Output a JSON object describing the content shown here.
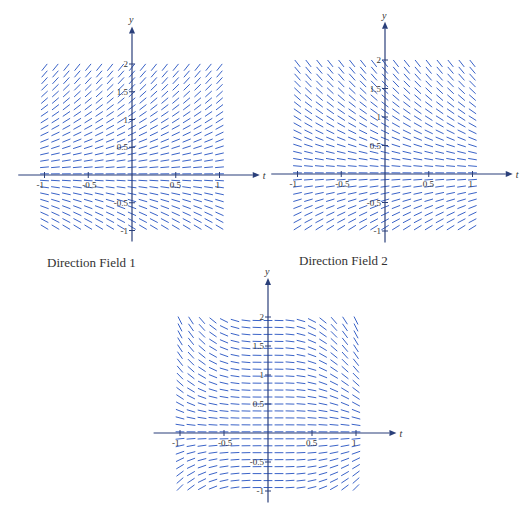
{
  "fields": [
    {
      "id": 1,
      "caption": "Direction Field 1",
      "slope": "y",
      "origin": [
        132,
        175
      ],
      "xscale": 87.5,
      "yscale": 55.5,
      "x_axis_label": "t",
      "y_axis_label": "y",
      "x_ticks": [
        "-1",
        "-0.5",
        "0.5",
        "1"
      ],
      "y_ticks": [
        "2",
        "1.5",
        "1",
        "0.5",
        "-0.5",
        "-1"
      ]
    },
    {
      "id": 2,
      "caption": "Direction Field 2",
      "slope": "-y",
      "origin": [
        385,
        174
      ],
      "xscale": 87.5,
      "yscale": 57,
      "x_axis_label": "t",
      "y_axis_label": "y",
      "x_ticks": [
        "-1",
        "-0.5",
        "0.5",
        "1"
      ],
      "y_ticks": [
        "2",
        "1.5",
        "1",
        "0.5",
        "-0.5",
        "-1"
      ]
    },
    {
      "id": 3,
      "caption": "",
      "slope": "-t^2 y",
      "origin": [
        268,
        433
      ],
      "xscale": 88,
      "yscale": 58,
      "x_axis_label": "t",
      "y_axis_label": "y",
      "x_ticks": [
        "-1",
        "-0.5",
        "0.5",
        "1"
      ],
      "y_ticks": [
        "2",
        "1.5",
        "1",
        "0.5",
        "-0.5",
        "-1"
      ]
    }
  ],
  "colors": {
    "segments": "#3a63c8",
    "axes": "#2a3f7a",
    "labels": "#333333"
  },
  "chart_data": [
    {
      "type": "direction_field",
      "title": "Direction Field 1",
      "xlabel": "t",
      "ylabel": "y",
      "xlim": [
        -1,
        1
      ],
      "ylim": [
        -1,
        2
      ],
      "x_ticks": [
        -1,
        -0.5,
        0.5,
        1
      ],
      "y_ticks": [
        -1,
        -0.5,
        0.5,
        1,
        1.5,
        2
      ],
      "slope_function": "dy/dt = y (approx.)",
      "grid": "17 columns x 26 rows of slope segments"
    },
    {
      "type": "direction_field",
      "title": "Direction Field 2",
      "xlabel": "t",
      "ylabel": "y",
      "xlim": [
        -1,
        1
      ],
      "ylim": [
        -1,
        2
      ],
      "x_ticks": [
        -1,
        -0.5,
        0.5,
        1
      ],
      "y_ticks": [
        -1,
        -0.5,
        0.5,
        1,
        1.5,
        2
      ],
      "slope_function": "dy/dt = -y (approx.)",
      "grid": "17 columns x 26 rows of slope segments"
    },
    {
      "type": "direction_field",
      "title": "",
      "xlabel": "t",
      "ylabel": "y",
      "xlim": [
        -1,
        1
      ],
      "ylim": [
        -1,
        2
      ],
      "x_ticks": [
        -1,
        -0.5,
        0.5,
        1
      ],
      "y_ticks": [
        -1,
        -0.5,
        0.5,
        1,
        1.5,
        2
      ],
      "slope_function": "dy/dt = -t^2 y (approx.)",
      "grid": "17 columns x 26 rows of slope segments"
    }
  ]
}
